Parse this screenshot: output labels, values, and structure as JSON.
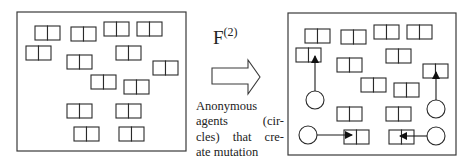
{
  "operator": {
    "symbol": "F",
    "superscript": "(2)"
  },
  "caption": {
    "lines": [
      "Anonymous",
      "agents (cir-",
      "cles) that cre-",
      "ate mutation"
    ],
    "words": [
      [
        "Anonymous"
      ],
      [
        "agents",
        "(cir-"
      ],
      [
        "cles)",
        "that",
        "cre-"
      ],
      [
        "ate",
        "mutation"
      ]
    ]
  },
  "colors": {
    "stroke": "#2a2a2a",
    "background": "#ffffff"
  },
  "left_panel": {
    "frame": {
      "x": 17,
      "y": 12,
      "w": 169,
      "h": 139
    },
    "pairs": [
      {
        "x": 35,
        "y": 26
      },
      {
        "x": 71,
        "y": 27
      },
      {
        "x": 104,
        "y": 22
      },
      {
        "x": 137,
        "y": 22
      },
      {
        "x": 26,
        "y": 46
      },
      {
        "x": 67,
        "y": 55
      },
      {
        "x": 116,
        "y": 46
      },
      {
        "x": 153,
        "y": 61
      },
      {
        "x": 91,
        "y": 75
      },
      {
        "x": 124,
        "y": 80
      },
      {
        "x": 67,
        "y": 104
      },
      {
        "x": 116,
        "y": 104
      },
      {
        "x": 74,
        "y": 127
      },
      {
        "x": 119,
        "y": 127
      }
    ]
  },
  "right_panel": {
    "frame": {
      "x": 288,
      "y": 13,
      "w": 168,
      "h": 142
    },
    "pairs": [
      {
        "x": 305,
        "y": 29
      },
      {
        "x": 341,
        "y": 30
      },
      {
        "x": 374,
        "y": 25
      },
      {
        "x": 407,
        "y": 25
      },
      {
        "x": 296,
        "y": 48
      },
      {
        "x": 337,
        "y": 58
      },
      {
        "x": 386,
        "y": 49
      },
      {
        "x": 423,
        "y": 64
      },
      {
        "x": 361,
        "y": 78
      },
      {
        "x": 394,
        "y": 83
      },
      {
        "x": 337,
        "y": 107
      },
      {
        "x": 386,
        "y": 107
      },
      {
        "x": 344,
        "y": 130
      },
      {
        "x": 389,
        "y": 130
      }
    ],
    "agents": [
      {
        "cx": 315,
        "cy": 100,
        "r": 9,
        "to": {
          "x": 315,
          "y": 56
        }
      },
      {
        "cx": 436,
        "cy": 109,
        "r": 9,
        "to": {
          "x": 436,
          "y": 72
        }
      },
      {
        "cx": 308,
        "cy": 135,
        "r": 9,
        "to": {
          "x": 352,
          "y": 135
        }
      },
      {
        "cx": 436,
        "cy": 136,
        "r": 9,
        "to": {
          "x": 400,
          "y": 136
        }
      }
    ]
  },
  "pair_size": {
    "w": 25,
    "h": 14
  }
}
